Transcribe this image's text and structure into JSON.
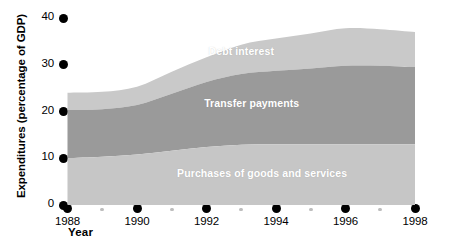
{
  "chart_data": {
    "type": "area",
    "stacked": true,
    "title": "",
    "subtitle": "",
    "xlabel": "Year",
    "ylabel": "Expenditures (percentage of GDP)",
    "xlim": [
      1988,
      1998
    ],
    "ylim": [
      0,
      40
    ],
    "grid": false,
    "legend_position": "inline-labels",
    "x": [
      1988,
      1989,
      1990,
      1991,
      1992,
      1993,
      1994,
      1995,
      1996,
      1997,
      1998
    ],
    "xtick_labels": [
      "1988",
      "1990",
      "1992",
      "1994",
      "1996",
      "1998"
    ],
    "xtick_values": [
      1988,
      1990,
      1992,
      1994,
      1996,
      1998
    ],
    "xminor_values": [
      1989,
      1991,
      1993,
      1995,
      1997
    ],
    "ytick_labels": [
      "0",
      "10",
      "20",
      "30",
      "40"
    ],
    "ytick_values": [
      0,
      10,
      20,
      30,
      40
    ],
    "series": [
      {
        "name": "Purchases of goods and services",
        "color": "#c6c6c6",
        "label_x": 1993.6,
        "label_y": 6.6,
        "values": [
          10.0,
          10.3,
          10.8,
          11.6,
          12.4,
          12.9,
          13.0,
          13.0,
          13.0,
          13.0,
          13.0
        ]
      },
      {
        "name": "Transfer payments",
        "color": "#9a9a9a",
        "label_x": 1993.3,
        "label_y": 21.5,
        "values": [
          10.3,
          10.2,
          10.6,
          12.2,
          13.9,
          15.1,
          15.7,
          16.2,
          16.8,
          16.8,
          16.5
        ]
      },
      {
        "name": "Debt interest",
        "color": "#c9c9c9",
        "label_x": 1993.0,
        "label_y": 32.7,
        "values": [
          3.7,
          3.7,
          3.9,
          4.7,
          5.3,
          6.3,
          6.9,
          7.5,
          8.0,
          7.8,
          7.5
        ]
      }
    ],
    "stack_tops": {
      "purchases": [
        10.0,
        10.3,
        10.8,
        11.6,
        12.4,
        12.9,
        13.0,
        13.0,
        13.0,
        13.0,
        13.0
      ],
      "transfers": [
        20.3,
        20.5,
        21.4,
        23.8,
        26.3,
        28.0,
        28.7,
        29.2,
        29.8,
        29.8,
        29.5
      ],
      "total": [
        24.0,
        24.2,
        25.3,
        28.5,
        31.6,
        34.3,
        35.6,
        36.7,
        37.8,
        37.6,
        37.0
      ]
    },
    "colors": {
      "band_bottom": "#c6c6c6",
      "band_middle": "#9a9a9a",
      "band_top": "#c9c9c9",
      "axis_dot": "#000000",
      "minor_dot": "#bdbdbd",
      "label_text": "#ffffff",
      "background": "#ffffff"
    }
  },
  "axes": {
    "ylabel": "Expenditures (percentage of GDP)",
    "xlabel": "Year"
  },
  "yticks": [
    {
      "label": "40",
      "value": 40
    },
    {
      "label": "30",
      "value": 30
    },
    {
      "label": "20",
      "value": 20
    },
    {
      "label": "10",
      "value": 10
    },
    {
      "label": "0",
      "value": 0
    }
  ],
  "xticks": [
    {
      "label": "1988",
      "value": 1988
    },
    {
      "label": "1990",
      "value": 1990
    },
    {
      "label": "1992",
      "value": 1992
    },
    {
      "label": "1994",
      "value": 1994
    },
    {
      "label": "1996",
      "value": 1996
    },
    {
      "label": "1998",
      "value": 1998
    }
  ],
  "xminor": [
    1989,
    1991,
    1993,
    1995,
    1997
  ],
  "series_labels": [
    {
      "name": "Debt interest"
    },
    {
      "name": "Transfer payments"
    },
    {
      "name": "Purchases of goods and services"
    }
  ]
}
